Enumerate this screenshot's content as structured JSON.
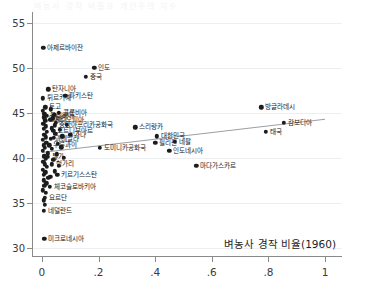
{
  "chart_data": {
    "type": "scatter",
    "title": "벼농사 경작 비율과 개인주의 지수",
    "xlabel": "벼농사 경작 비율(1960)",
    "ylabel": "",
    "xlim": [
      -0.035,
      1.06
    ],
    "ylim": [
      29.0,
      56.2
    ],
    "xticks": [
      "0",
      ".2",
      ".4",
      ".6",
      ".8",
      "1"
    ],
    "xtick_values": [
      0,
      0.2,
      0.4,
      0.6,
      0.8,
      1.0
    ],
    "yticks": [
      "30",
      "35",
      "40",
      "45",
      "50",
      "55"
    ],
    "ytick_values": [
      30,
      35,
      40,
      45,
      50,
      55
    ],
    "grid": true,
    "grid_axis": "y",
    "legend": "none",
    "marker_color": "#1c1c1c",
    "fitline_color": "#9aa0a6",
    "fitline": {
      "label": "선형 적합선",
      "x_start": 0.0,
      "y_start": 40.6,
      "x_end": 1.0,
      "y_end": 44.3
    },
    "points": [
      {
        "label": "아제르바이잔",
        "x": 0.005,
        "y": 52.2,
        "side": "right"
      },
      {
        "label": "인도",
        "x": 0.185,
        "y": 50.0,
        "side": "right"
      },
      {
        "label": "중국",
        "x": 0.155,
        "y": 49.0,
        "side": "right"
      },
      {
        "label": "탄자니아",
        "x": 0.022,
        "y": 47.6,
        "side": "right"
      },
      {
        "label": "튀르키예",
        "x": 0.004,
        "y": 46.6,
        "side": "right"
      },
      {
        "label": "파키스탄",
        "x": 0.082,
        "y": 46.9,
        "side": "right"
      },
      {
        "label": "토고",
        "x": 0.012,
        "y": 45.6,
        "side": "right"
      },
      {
        "label": "콜롬비아",
        "x": 0.06,
        "y": 45.0,
        "side": "right"
      },
      {
        "label": "볼리비아",
        "x": 0.016,
        "y": 44.7,
        "side": "right"
      },
      {
        "label": "알제리",
        "x": 0.01,
        "y": 44.3,
        "side": "right"
      },
      {
        "label": "대한민국",
        "x": 0.405,
        "y": 42.4,
        "side": "right"
      },
      {
        "label": "필리핀",
        "x": 0.4,
        "y": 41.7,
        "side": "right"
      },
      {
        "label": "스리랑카",
        "x": 0.33,
        "y": 43.4,
        "side": "right"
      },
      {
        "label": "방글라데시",
        "x": 0.775,
        "y": 45.6,
        "side": "right"
      },
      {
        "label": "캄보디아",
        "x": 0.855,
        "y": 43.9,
        "side": "right"
      },
      {
        "label": "태국",
        "x": 0.79,
        "y": 42.9,
        "side": "right"
      },
      {
        "label": "네팔",
        "x": 0.47,
        "y": 41.8,
        "side": "right"
      },
      {
        "label": "인도네시아",
        "x": 0.45,
        "y": 40.8,
        "side": "right"
      },
      {
        "label": "마다가스카르",
        "x": 0.545,
        "y": 39.1,
        "side": "right"
      },
      {
        "label": "도미니카공화국",
        "x": 0.205,
        "y": 41.1,
        "side": "right"
      },
      {
        "label": "가나",
        "x": 0.1,
        "y": 42.6,
        "side": "right"
      },
      {
        "label": "중앙아프리카공화국",
        "x": 0.046,
        "y": 43.6,
        "side": "right"
      },
      {
        "label": "에티오피아",
        "x": 0.03,
        "y": 44.2,
        "side": "right"
      },
      {
        "label": "코트디부아르",
        "x": 0.04,
        "y": 43.0,
        "side": "right"
      },
      {
        "label": "과테말라",
        "x": 0.032,
        "y": 42.1,
        "side": "right"
      },
      {
        "label": "우루과이",
        "x": 0.026,
        "y": 41.4,
        "side": "right"
      },
      {
        "label": "통가",
        "x": 0.02,
        "y": 40.1,
        "side": "right"
      },
      {
        "label": "헝가리",
        "x": 0.036,
        "y": 39.3,
        "side": "right"
      },
      {
        "label": "키르기스스탄",
        "x": 0.055,
        "y": 38.1,
        "side": "right"
      },
      {
        "label": "체코슬로바키아",
        "x": 0.028,
        "y": 36.8,
        "side": "right"
      },
      {
        "label": "요르단",
        "x": 0.01,
        "y": 35.6,
        "side": "right"
      },
      {
        "label": "네덜란드",
        "x": 0.006,
        "y": 34.1,
        "side": "right"
      },
      {
        "label": "미크로네시아",
        "x": 0.008,
        "y": 31.0,
        "side": "right"
      },
      {
        "label": "",
        "x": 0.004,
        "y": 45.2,
        "side": "right"
      },
      {
        "label": "",
        "x": 0.008,
        "y": 44.9,
        "side": "right"
      },
      {
        "label": "",
        "x": 0.006,
        "y": 44.5,
        "side": "right"
      },
      {
        "label": "",
        "x": 0.012,
        "y": 44.1,
        "side": "right"
      },
      {
        "label": "",
        "x": 0.005,
        "y": 43.8,
        "side": "right"
      },
      {
        "label": "",
        "x": 0.014,
        "y": 43.5,
        "side": "right"
      },
      {
        "label": "",
        "x": 0.007,
        "y": 43.2,
        "side": "right"
      },
      {
        "label": "",
        "x": 0.018,
        "y": 42.9,
        "side": "right"
      },
      {
        "label": "",
        "x": 0.009,
        "y": 42.6,
        "side": "right"
      },
      {
        "label": "",
        "x": 0.013,
        "y": 42.3,
        "side": "right"
      },
      {
        "label": "",
        "x": 0.004,
        "y": 42.0,
        "side": "right"
      },
      {
        "label": "",
        "x": 0.016,
        "y": 41.7,
        "side": "right"
      },
      {
        "label": "",
        "x": 0.006,
        "y": 41.4,
        "side": "right"
      },
      {
        "label": "",
        "x": 0.011,
        "y": 41.1,
        "side": "right"
      },
      {
        "label": "",
        "x": 0.003,
        "y": 40.8,
        "side": "right"
      },
      {
        "label": "",
        "x": 0.02,
        "y": 40.5,
        "side": "right"
      },
      {
        "label": "",
        "x": 0.008,
        "y": 40.2,
        "side": "right"
      },
      {
        "label": "",
        "x": 0.014,
        "y": 39.9,
        "side": "right"
      },
      {
        "label": "",
        "x": 0.005,
        "y": 39.6,
        "side": "right"
      },
      {
        "label": "",
        "x": 0.01,
        "y": 39.3,
        "side": "right"
      },
      {
        "label": "",
        "x": 0.017,
        "y": 39.0,
        "side": "right"
      },
      {
        "label": "",
        "x": 0.004,
        "y": 38.7,
        "side": "right"
      },
      {
        "label": "",
        "x": 0.012,
        "y": 38.4,
        "side": "right"
      },
      {
        "label": "",
        "x": 0.007,
        "y": 38.1,
        "side": "right"
      },
      {
        "label": "",
        "x": 0.022,
        "y": 37.8,
        "side": "right"
      },
      {
        "label": "",
        "x": 0.006,
        "y": 37.5,
        "side": "right"
      },
      {
        "label": "",
        "x": 0.015,
        "y": 37.2,
        "side": "right"
      },
      {
        "label": "",
        "x": 0.009,
        "y": 36.9,
        "side": "right"
      },
      {
        "label": "",
        "x": 0.004,
        "y": 36.4,
        "side": "right"
      },
      {
        "label": "",
        "x": 0.013,
        "y": 36.1,
        "side": "right"
      },
      {
        "label": "",
        "x": 0.006,
        "y": 35.3,
        "side": "right"
      },
      {
        "label": "",
        "x": 0.01,
        "y": 34.8,
        "side": "right"
      },
      {
        "label": "",
        "x": 0.032,
        "y": 45.4,
        "side": "right"
      },
      {
        "label": "",
        "x": 0.044,
        "y": 44.8,
        "side": "right"
      },
      {
        "label": "",
        "x": 0.038,
        "y": 44.4,
        "side": "right"
      },
      {
        "label": "",
        "x": 0.05,
        "y": 43.9,
        "side": "right"
      },
      {
        "label": "",
        "x": 0.034,
        "y": 43.3,
        "side": "right"
      },
      {
        "label": "",
        "x": 0.048,
        "y": 42.7,
        "side": "right"
      },
      {
        "label": "",
        "x": 0.042,
        "y": 42.2,
        "side": "right"
      },
      {
        "label": "",
        "x": 0.056,
        "y": 41.6,
        "side": "right"
      },
      {
        "label": "",
        "x": 0.036,
        "y": 41.0,
        "side": "right"
      },
      {
        "label": "",
        "x": 0.052,
        "y": 40.4,
        "side": "right"
      },
      {
        "label": "",
        "x": 0.04,
        "y": 39.8,
        "side": "right"
      },
      {
        "label": "",
        "x": 0.06,
        "y": 39.1,
        "side": "right"
      },
      {
        "label": "",
        "x": 0.046,
        "y": 38.5,
        "side": "right"
      },
      {
        "label": "",
        "x": 0.03,
        "y": 37.9,
        "side": "right"
      },
      {
        "label": "",
        "x": 0.064,
        "y": 43.1,
        "side": "right"
      },
      {
        "label": "",
        "x": 0.072,
        "y": 42.4,
        "side": "right"
      },
      {
        "label": "",
        "x": 0.068,
        "y": 41.2,
        "side": "right"
      },
      {
        "label": "",
        "x": 0.078,
        "y": 40.0,
        "side": "right"
      },
      {
        "label": "",
        "x": 0.088,
        "y": 43.7,
        "side": "right"
      }
    ]
  }
}
